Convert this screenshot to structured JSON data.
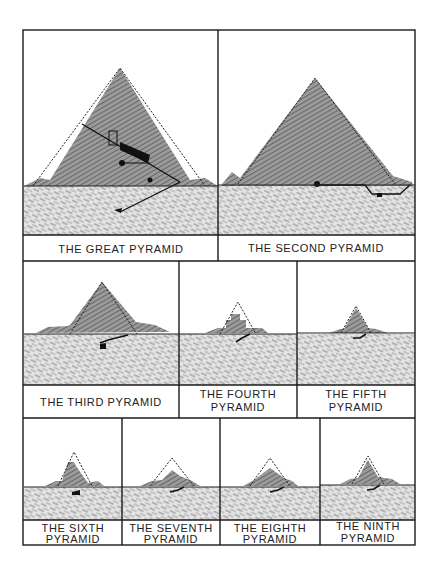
{
  "figure": {
    "panels": [
      {
        "id": "great",
        "line1": "THE GREAT PYRAMID",
        "line2": ""
      },
      {
        "id": "second",
        "line1": "THE SECOND PYRAMID",
        "line2": ""
      },
      {
        "id": "third",
        "line1": "THE THIRD PYRAMID",
        "line2": ""
      },
      {
        "id": "fourth",
        "line1": "THE FOURTH",
        "line2": "PYRAMID"
      },
      {
        "id": "fifth",
        "line1": "THE FIFTH",
        "line2": "PYRAMID"
      },
      {
        "id": "sixth",
        "line1": "THE SIXTH",
        "line2": "PYRAMID"
      },
      {
        "id": "seventh",
        "line1": "THE SEVENTH",
        "line2": "PYRAMID"
      },
      {
        "id": "eighth",
        "line1": "THE EIGHTH",
        "line2": "PYRAMID"
      },
      {
        "id": "ninth",
        "line1": "THE NINTH",
        "line2": "PYRAMID"
      }
    ],
    "colors": {
      "line": "#1a1a1a",
      "fill": "#8a8a8a",
      "ground": "#cfcfcf"
    }
  }
}
